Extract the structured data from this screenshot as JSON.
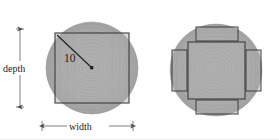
{
  "figure": {
    "background_color": "#ffffff",
    "wood_fill_color": "#aaaaaa",
    "wood_fill_light": "#b4b4b4",
    "wood_grain_color": "#9a9a9a",
    "outline_color": "#3c3c3c",
    "dimension_line_color": "#555555",
    "text_color": "#1c1c1c",
    "left_diagram": {
      "name": "single-square-from-log",
      "radius_label": "10",
      "depth_label": "depth",
      "width_label": "width",
      "circle": {
        "cx": 92,
        "cy": 68,
        "r": 46
      },
      "square": {
        "x": 55,
        "y": 33,
        "w": 74,
        "h": 70
      },
      "radius_line": {
        "x1": 57,
        "y1": 35,
        "x2": 92,
        "y2": 68
      }
    },
    "right_diagram": {
      "name": "square-with-four-side-boards",
      "circle": {
        "cx": 216,
        "cy": 70,
        "r": 46
      },
      "center_square": {
        "x": 188,
        "y": 42,
        "w": 57,
        "h": 57
      },
      "boards": [
        {
          "name": "top-board",
          "x": 196,
          "y": 27,
          "w": 42,
          "h": 14
        },
        {
          "name": "bottom-board",
          "x": 196,
          "y": 100,
          "w": 42,
          "h": 14
        },
        {
          "name": "left-board",
          "x": 172,
          "y": 50,
          "w": 15,
          "h": 41
        },
        {
          "name": "right-board",
          "x": 246,
          "y": 50,
          "w": 15,
          "h": 41
        }
      ]
    },
    "depth_dimension": {
      "axis_x": 20,
      "y_top": 29,
      "y_bottom": 107,
      "label": "depth"
    },
    "width_dimension": {
      "axis_y": 126,
      "x_left": 42,
      "x_right": 133,
      "label": "width"
    }
  }
}
